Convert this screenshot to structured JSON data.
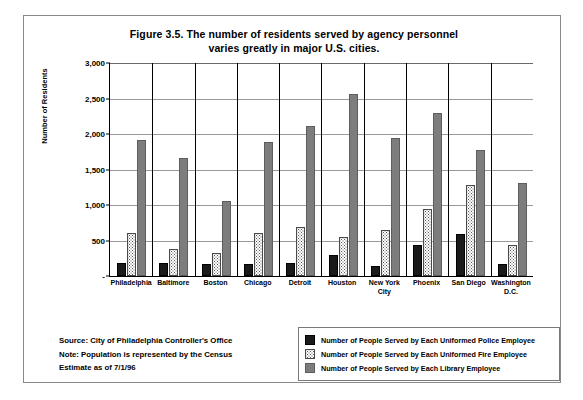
{
  "figure": {
    "title_line1": "Figure 3.5. The number of residents served by agency personnel",
    "title_line2": "varies greatly in major U.S. cities."
  },
  "notes": {
    "source": "Source: City of Philadelphia Controller's Office",
    "note": "Note: Population is represented by the Census",
    "estimate": "Estimate as of 7/1/96"
  },
  "legend": {
    "items": [
      {
        "key": "police",
        "label": "Number of People Served by Each Uniformed Police Employee",
        "swatch": "black-swatch",
        "color": "#1a1a1a"
      },
      {
        "key": "fire",
        "label": "Number of People Served by Each Uniformed Fire Employee",
        "swatch": "dotted-swatch",
        "color": "#ffffff"
      },
      {
        "key": "library",
        "label": "Number of People Served by Each Library Employee",
        "swatch": "gray-swatch",
        "color": "#7d7d7d"
      }
    ]
  },
  "chart_data": {
    "type": "bar",
    "title": "Figure 3.5. The number of residents served by agency personnel varies greatly in major U.S. cities.",
    "xlabel": "",
    "ylabel": "Number of Residents",
    "ylim": [
      0,
      3000
    ],
    "ytick_labels": [
      "3,000",
      "2,500",
      "2,000",
      "1,500",
      "1,000",
      "500",
      "-"
    ],
    "ytick_values": [
      3000,
      2500,
      2000,
      1500,
      1000,
      500,
      0
    ],
    "grid": true,
    "legend_position": "bottom-right",
    "categories": [
      "Philadelphia",
      "Baltimore",
      "Boston",
      "Chicago",
      "Detroit",
      "Houston",
      "New York\nCity",
      "Phoenix",
      "San Diego",
      "Washington D.C."
    ],
    "series": [
      {
        "name": "Number of People Served by Each Uniformed Police Employee",
        "key": "police",
        "color": "#1a1a1a",
        "values": [
          180,
          185,
          175,
          165,
          190,
          290,
          140,
          430,
          590,
          165
        ]
      },
      {
        "name": "Number of People Served by Each Uniformed Fire Employee",
        "key": "fire",
        "color": "#ffffff",
        "values": [
          600,
          380,
          320,
          610,
          690,
          550,
          650,
          950,
          1280,
          430
        ]
      },
      {
        "name": "Number of People Served by Each Library Employee",
        "key": "library",
        "color": "#7d7d7d",
        "values": [
          1920,
          1660,
          1055,
          1890,
          2110,
          2570,
          1950,
          2290,
          1780,
          1310
        ]
      }
    ]
  }
}
